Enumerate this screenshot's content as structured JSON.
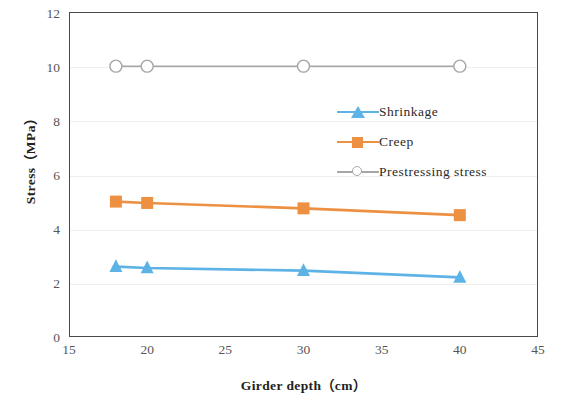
{
  "chart_data": {
    "type": "line",
    "title": "",
    "xlabel": "Girder depth（cm）",
    "ylabel": "Stress（MPa）",
    "x": [
      18,
      20,
      30,
      40
    ],
    "xlim": [
      15,
      45
    ],
    "ylim": [
      0,
      12
    ],
    "xticks": [
      15,
      20,
      25,
      30,
      35,
      40,
      45
    ],
    "yticks": [
      0,
      2,
      4,
      6,
      8,
      10,
      12
    ],
    "grid": true,
    "grid_axis": "y",
    "legend_position": "center-right",
    "series": [
      {
        "name": "Shrinkage",
        "values": [
          2.6,
          2.55,
          2.45,
          2.2
        ],
        "color": "#5DB3E5",
        "marker": "triangle"
      },
      {
        "name": "Creep",
        "values": [
          5.0,
          4.95,
          4.75,
          4.5
        ],
        "color": "#ED9042",
        "marker": "square"
      },
      {
        "name": "Prestressing stress",
        "values": [
          10.0,
          10.0,
          10.0,
          10.0
        ],
        "color": "#A6A6A6",
        "marker": "circle-open"
      }
    ]
  },
  "axes": {
    "y_title": "Stress（MPa）",
    "x_title": "Girder depth（cm）",
    "yticks": [
      "0",
      "2",
      "4",
      "6",
      "8",
      "10",
      "12"
    ],
    "xticks": [
      "15",
      "20",
      "25",
      "30",
      "35",
      "40",
      "45"
    ]
  },
  "legend": {
    "items": [
      {
        "label": "Shrinkage",
        "color": "#5DB3E5",
        "marker": "triangle-icon"
      },
      {
        "label": "Creep",
        "color": "#ED9042",
        "marker": "square-icon"
      },
      {
        "label": "Prestressing stress",
        "color": "#A6A6A6",
        "marker": "circle-open-icon"
      }
    ]
  },
  "colors": {
    "shrinkage": "#5DB3E5",
    "creep": "#ED9042",
    "prestressing": "#A6A6A6",
    "axis": "#4A4A4A",
    "grid": "#F0EEEC",
    "tick_text": "#565656",
    "title_text": "#231F20"
  }
}
